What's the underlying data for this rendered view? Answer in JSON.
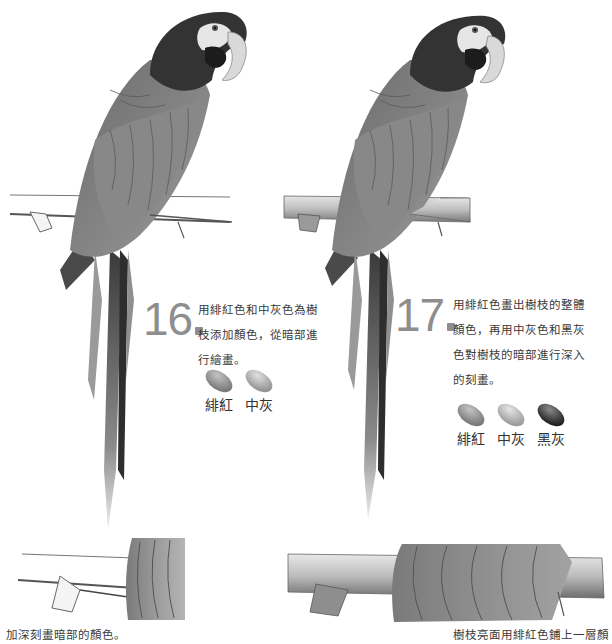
{
  "steps": [
    {
      "number": "16",
      "text_lines": [
        "用緋紅色和中灰色為樹",
        "枝添加顏色，從暗部進",
        "行繪畫。"
      ],
      "swatches": [
        {
          "label": "緋紅",
          "color": "#8a8a8a"
        },
        {
          "label": "中灰",
          "color": "#a6a6a6"
        }
      ]
    },
    {
      "number": "17",
      "text_lines": [
        "用緋紅色畫出樹枝的整體",
        "顏色，再用中灰色和黑灰",
        "色對樹枝的暗部進行深入",
        "的刻畫。"
      ],
      "swatches": [
        {
          "label": "緋紅",
          "color": "#8c8c8c"
        },
        {
          "label": "中灰",
          "color": "#b0b0b0"
        },
        {
          "label": "黑灰",
          "color": "#3a3a3a"
        }
      ]
    }
  ],
  "captions": {
    "left_bottom": "加深刻畫暗部的顏色。",
    "right_bottom": "樹枝亮面用緋紅色鋪上一層顏"
  },
  "illustrations": {
    "left": "parrot-on-branch-step-16",
    "right": "parrot-on-branch-step-17",
    "left_detail": "branch-detail-step-16",
    "right_detail": "branch-detail-step-17"
  }
}
